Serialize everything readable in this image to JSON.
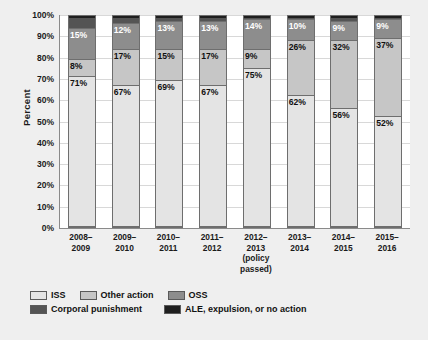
{
  "chart_data": {
    "type": "bar",
    "subtype": "stacked-100-percent",
    "title": "",
    "xlabel": "",
    "ylabel": "Percent",
    "ylim": [
      0,
      100
    ],
    "ytick_labels": [
      "100%",
      "90%",
      "80%",
      "70%",
      "60%",
      "50%",
      "40%",
      "30%",
      "20%",
      "10%",
      "0%"
    ],
    "ytick_values": [
      100,
      90,
      80,
      70,
      60,
      50,
      40,
      30,
      20,
      10,
      0
    ],
    "grid": true,
    "legend_position": "bottom-left",
    "categories": [
      "2008–2009",
      "2009–2010",
      "2010–2011",
      "2011–2012",
      "2012–2013 (policy passed)",
      "2013–2014",
      "2014–2015",
      "2015–2016"
    ],
    "category_lines": [
      [
        "2008–",
        "2009"
      ],
      [
        "2009–",
        "2010"
      ],
      [
        "2010–",
        "2011"
      ],
      [
        "2011–",
        "2012"
      ],
      [
        "2012–",
        "2013",
        "(policy",
        "passed)"
      ],
      [
        "2013–",
        "2014"
      ],
      [
        "2014–",
        "2015"
      ],
      [
        "2015–",
        "2016"
      ]
    ],
    "series": [
      {
        "name": "ISS",
        "color": "#e4e4e4",
        "values": [
          71,
          67,
          69,
          67,
          75,
          62,
          56,
          52
        ],
        "labels": [
          "71%",
          "67%",
          "69%",
          "67%",
          "75%",
          "62%",
          "56%",
          "52%"
        ],
        "label_color": "dark"
      },
      {
        "name": "Other action",
        "color": "#c6c6c6",
        "values": [
          8,
          17,
          15,
          17,
          9,
          26,
          32,
          37
        ],
        "labels": [
          "8%",
          "17%",
          "15%",
          "17%",
          "9%",
          "26%",
          "32%",
          "37%"
        ],
        "label_color": "dark"
      },
      {
        "name": "OSS",
        "color": "#8d8d8d",
        "values": [
          15,
          12,
          13,
          13,
          14,
          10,
          9,
          9
        ],
        "labels": [
          "15%",
          "12%",
          "13%",
          "13%",
          "14%",
          "10%",
          "9%",
          "9%"
        ],
        "label_color": "light"
      },
      {
        "name": "Corporal punishment",
        "color": "#545454",
        "values": [
          5,
          3,
          2,
          2,
          1,
          1,
          2,
          1
        ],
        "labels": [
          "",
          "",
          "",
          "",
          "",
          "",
          "",
          ""
        ],
        "label_color": "light"
      },
      {
        "name": "ALE, expulsion, or no action",
        "color": "#1f1f1f",
        "values": [
          1,
          1,
          1,
          1,
          1,
          1,
          1,
          1
        ],
        "labels": [
          "",
          "",
          "",
          "",
          "",
          "",
          "",
          ""
        ],
        "label_color": "light"
      }
    ]
  },
  "legend": {
    "row1": [
      {
        "label": "ISS",
        "color": "#e4e4e4"
      },
      {
        "label": "Other action",
        "color": "#c6c6c6"
      },
      {
        "label": "OSS",
        "color": "#8d8d8d"
      }
    ],
    "row2": [
      {
        "label": "Corporal punishment",
        "color": "#545454"
      },
      {
        "label": "ALE, expulsion, or no action",
        "color": "#1f1f1f"
      }
    ]
  }
}
